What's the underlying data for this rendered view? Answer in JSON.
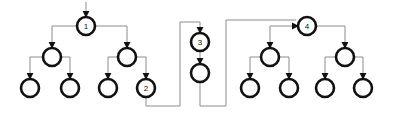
{
  "diagram": {
    "type": "tree-graph",
    "width": 395,
    "height": 113,
    "background_color": "#ffffff",
    "node_stroke_color": "#111111",
    "node_fill_color": "#ffffff",
    "wire_color": "#8d8d8d",
    "arrow_color": "#111111",
    "node_radius": 9,
    "labels": {
      "n1": "1",
      "n2": "2",
      "n3": "3",
      "n4": "4"
    },
    "nodes": [
      {
        "id": "n1",
        "cx": 86,
        "cy": 26,
        "r": 9,
        "label": "1"
      },
      {
        "id": "n1a",
        "cx": 52,
        "cy": 57,
        "r": 9,
        "label": ""
      },
      {
        "id": "n1b",
        "cx": 127,
        "cy": 57,
        "r": 9,
        "label": ""
      },
      {
        "id": "n1a1",
        "cx": 30,
        "cy": 88,
        "r": 9,
        "label": ""
      },
      {
        "id": "n1a2",
        "cx": 70,
        "cy": 88,
        "r": 9,
        "label": ""
      },
      {
        "id": "n1b1",
        "cx": 108,
        "cy": 88,
        "r": 9,
        "label": ""
      },
      {
        "id": "n2",
        "cx": 146,
        "cy": 88,
        "r": 9,
        "label": "2"
      },
      {
        "id": "n3",
        "cx": 200,
        "cy": 42,
        "r": 9,
        "label": "3"
      },
      {
        "id": "n3a",
        "cx": 200,
        "cy": 73,
        "r": 9,
        "label": ""
      },
      {
        "id": "n4",
        "cx": 307,
        "cy": 26,
        "r": 9,
        "label": "4"
      },
      {
        "id": "n4a",
        "cx": 270,
        "cy": 57,
        "r": 9,
        "label": ""
      },
      {
        "id": "n4b",
        "cx": 345,
        "cy": 57,
        "r": 9,
        "label": ""
      },
      {
        "id": "n4a1",
        "cx": 250,
        "cy": 88,
        "r": 9,
        "label": ""
      },
      {
        "id": "n4a2",
        "cx": 289,
        "cy": 88,
        "r": 9,
        "label": ""
      },
      {
        "id": "n4b1",
        "cx": 325,
        "cy": 88,
        "r": 9,
        "label": ""
      },
      {
        "id": "n4b2",
        "cx": 363,
        "cy": 88,
        "r": 9,
        "label": ""
      }
    ],
    "edges": [
      {
        "from": "entry",
        "to": "n1",
        "path": "M 86 2 L 86 15",
        "arrow": "down"
      },
      {
        "from": "n1",
        "to": "n1a",
        "path": "M 86 26 L 52 26 L 52 46",
        "arrow": "down"
      },
      {
        "from": "n1",
        "to": "n1b",
        "path": "M 86 26 L 127 26 L 127 46",
        "arrow": "down"
      },
      {
        "from": "n1a",
        "to": "n1a1",
        "path": "M 52 57 L 30 57 L 30 77",
        "arrow": "down"
      },
      {
        "from": "n1a",
        "to": "n1a2",
        "path": "M 52 57 L 70 57 L 70 77",
        "arrow": "down"
      },
      {
        "from": "n1b",
        "to": "n1b1",
        "path": "M 127 57 L 108 57 L 108 77",
        "arrow": "down"
      },
      {
        "from": "n1b",
        "to": "n2",
        "path": "M 127 57 L 146 57 L 146 77",
        "arrow": "down"
      },
      {
        "from": "n2",
        "to": "n3",
        "path": "M 146 97 L 146 106 L 180 106 L 180 22 L 200 22 L 200 31",
        "arrow": "down"
      },
      {
        "from": "n3",
        "to": "n3a",
        "path": "M 200 42 L 200 62",
        "arrow": "down"
      },
      {
        "from": "n3a",
        "to": "n4",
        "path": "M 200 82 L 200 106 L 226 106 L 226 20 L 296 20",
        "arrow": "right"
      },
      {
        "from": "n4",
        "to": "n4a",
        "path": "M 307 26 L 270 26 L 270 46",
        "arrow": "down"
      },
      {
        "from": "n4",
        "to": "n4b",
        "path": "M 307 26 L 345 26 L 345 46",
        "arrow": "down"
      },
      {
        "from": "n4a",
        "to": "n4a1",
        "path": "M 270 57 L 250 57 L 250 77",
        "arrow": "down"
      },
      {
        "from": "n4a",
        "to": "n4a2",
        "path": "M 270 57 L 289 57 L 289 77",
        "arrow": "down"
      },
      {
        "from": "n4b",
        "to": "n4b1",
        "path": "M 345 57 L 325 57 L 325 77",
        "arrow": "down"
      },
      {
        "from": "n4b",
        "to": "n4b2",
        "path": "M 345 57 L 363 57 L 363 77",
        "arrow": "down"
      }
    ]
  }
}
